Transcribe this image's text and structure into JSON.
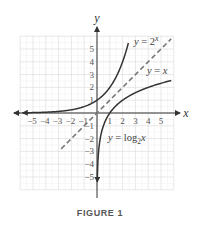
{
  "chart_data": {
    "type": "line",
    "title": "",
    "caption": "FIGURE 1",
    "xlabel": "x",
    "ylabel": "y",
    "xlim": [
      -6,
      6
    ],
    "ylim": [
      -6,
      6
    ],
    "grid": true,
    "x_ticks": [
      "-5",
      "-4",
      "-3",
      "-2",
      "-1",
      "1",
      "2",
      "3",
      "4",
      "5"
    ],
    "x_tick_values": [
      -5,
      -4,
      -3,
      -2,
      -1,
      1,
      2,
      3,
      4,
      5
    ],
    "y_ticks": [
      "5",
      "4",
      "3",
      "2",
      "1",
      "-1",
      "-2",
      "-3",
      "-4",
      "-5"
    ],
    "y_tick_values": [
      5,
      4,
      3,
      2,
      1,
      -1,
      -2,
      -3,
      -4,
      -5
    ],
    "series": [
      {
        "name": "exp2",
        "label": "y = 2^x",
        "label_parts": {
          "lhs": "y",
          "eq": " = 2",
          "sup": "x"
        },
        "function": "2^x",
        "domain": [
          -5.8,
          2.45
        ],
        "style": "solid",
        "color": "#333333"
      },
      {
        "name": "identity",
        "label": "y = x",
        "label_parts": {
          "lhs": "y",
          "eq": " = ",
          "rhs": "x"
        },
        "function": "x",
        "domain": [
          -2.8,
          5.8
        ],
        "style": "dashed",
        "color": "#777777"
      },
      {
        "name": "log2",
        "label": "y = log2 x",
        "label_parts": {
          "lhs": "y",
          "eq": " = log",
          "sub": "2",
          "rhs": "x"
        },
        "function": "log2(x)",
        "domain": [
          0.024,
          5.8
        ],
        "style": "solid",
        "color": "#333333"
      }
    ]
  }
}
